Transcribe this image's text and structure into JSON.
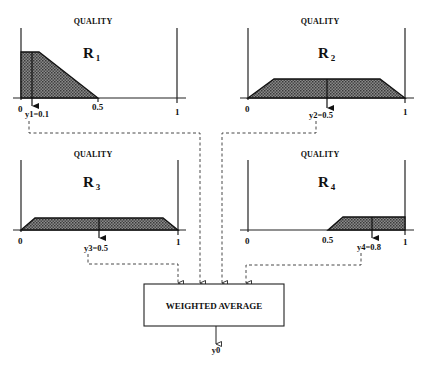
{
  "diagram": {
    "panels": [
      {
        "id": "R1",
        "header": "QUALITY",
        "rule_letter": "R",
        "rule_index": "1",
        "ticks": [
          "0",
          "0.5",
          "1"
        ],
        "output_label": "y1=0.1",
        "shape": "right-shoulder decreasing: full from 0 to ~0.1, falling to 0 at 0.5",
        "output_value": 0.1
      },
      {
        "id": "R2",
        "header": "QUALITY",
        "rule_letter": "R",
        "rule_index": "2",
        "ticks": [
          "0",
          "1"
        ],
        "output_label": "y2=0.5",
        "shape": "trapezoid from 0 to 1, clipped plateau",
        "output_value": 0.5
      },
      {
        "id": "R3",
        "header": "QUALITY",
        "rule_letter": "R",
        "rule_index": "3",
        "ticks": [
          "0",
          "1"
        ],
        "output_label": "y3=0.5",
        "shape": "trapezoid from 0 to 1, low clipped plateau",
        "output_value": 0.5
      },
      {
        "id": "R4",
        "header": "QUALITY",
        "rule_letter": "R",
        "rule_index": "4",
        "ticks": [
          "0",
          "0.5",
          "1"
        ],
        "output_label": "y4=0.8",
        "shape": "rising from 0.5 to plateau up to 1, low clip",
        "output_value": 0.8
      }
    ],
    "aggregator": {
      "label": "WEIGHTED AVERAGE",
      "output_label": "y0"
    }
  }
}
